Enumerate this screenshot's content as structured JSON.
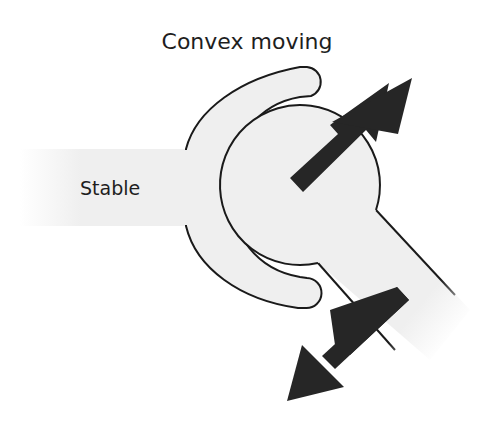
{
  "title": "Convex moving",
  "labels": {
    "stable": "Stable"
  },
  "icons": {
    "up_arrow": "arrow-up-right",
    "down_arrow": "arrow-down-left"
  },
  "colors": {
    "fill": "#efefef",
    "stroke": "#1a1a1a",
    "arrow": "#262626",
    "background": "#ffffff"
  }
}
